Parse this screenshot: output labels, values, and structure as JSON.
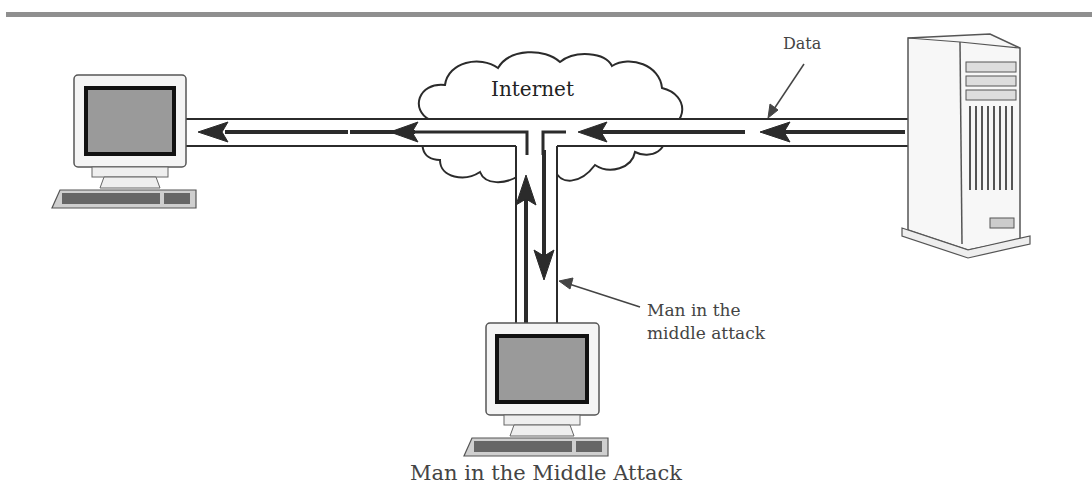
{
  "diagram": {
    "caption": "Man in the Middle Attack",
    "cloud_label": "Internet",
    "data_label": "Data",
    "attack_label_line1": "Man in the",
    "attack_label_line2": "middle attack",
    "nodes": [
      {
        "id": "client",
        "type": "desktop-computer",
        "position": "left"
      },
      {
        "id": "server",
        "type": "tower-server",
        "position": "right"
      },
      {
        "id": "attacker",
        "type": "desktop-computer",
        "position": "bottom-center"
      },
      {
        "id": "internet",
        "type": "cloud",
        "position": "top-center"
      }
    ],
    "flows": [
      {
        "from": "server",
        "to": "internet",
        "direction": "left"
      },
      {
        "from": "internet",
        "to": "attacker",
        "direction": "down"
      },
      {
        "from": "attacker",
        "to": "internet",
        "direction": "up"
      },
      {
        "from": "internet",
        "to": "client",
        "direction": "left"
      }
    ],
    "colors": {
      "line": "#2b2b2b",
      "screen": "#9a9a9a",
      "bezel": "#111111",
      "case": "#f2f2f2",
      "rule": "#8f8f8f"
    }
  }
}
